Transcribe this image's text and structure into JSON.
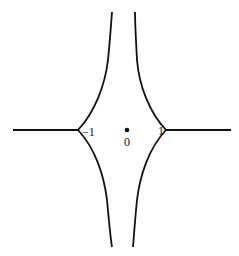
{
  "diagram": {
    "labels": {
      "neg_one": "−1",
      "one": "1",
      "zero": "0"
    },
    "colors": {
      "stroke": "#111111",
      "background": "#ffffff"
    }
  }
}
